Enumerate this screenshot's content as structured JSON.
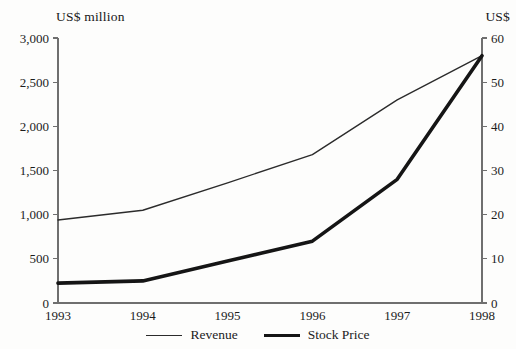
{
  "chart_data": {
    "type": "line",
    "title": "",
    "xlabel": "",
    "ylabel": "US$ million",
    "y2label": "US$",
    "categories": [
      "1993",
      "1994",
      "1995",
      "1996",
      "1997",
      "1998"
    ],
    "x": [
      1993,
      1994,
      1995,
      1996,
      1997,
      1998
    ],
    "xlim": [
      1993,
      1998
    ],
    "ylim": [
      0,
      3000
    ],
    "y2lim": [
      0,
      60
    ],
    "grid": false,
    "legend_position": "bottom-center",
    "series": [
      {
        "name": "Revenue",
        "axis": "left",
        "units": "US$ million",
        "line_style": "thin",
        "color": "#2b2b2b",
        "values": [
          940,
          1050,
          1360,
          1680,
          2300,
          2800
        ],
        "vertices": [
          1993,
          1994,
          1996,
          1997,
          1998
        ]
      },
      {
        "name": "Stock Price",
        "axis": "right",
        "units": "US$",
        "line_style": "thick",
        "color": "#151515",
        "values": [
          4.5,
          5.0,
          9.5,
          14.0,
          28.0,
          56.0
        ],
        "vertices": [
          1993,
          1994,
          1996,
          1997,
          1998
        ]
      }
    ],
    "y_ticks": [
      0,
      500,
      1000,
      1500,
      2000,
      2500,
      3000
    ],
    "y_tick_labels": [
      "0",
      "500",
      "1,000",
      "1,500",
      "2,000",
      "2,500",
      "3,000"
    ],
    "y2_ticks": [
      0,
      10,
      20,
      30,
      40,
      50,
      60
    ],
    "y2_tick_labels": [
      "0",
      "10",
      "20",
      "30",
      "40",
      "50",
      "60"
    ],
    "x_tick_labels": [
      "1993",
      "1994",
      "1995",
      "1996",
      "1997",
      "1998"
    ]
  },
  "axes": {
    "left_caption": "US$ million",
    "right_caption": "US$"
  },
  "legend": {
    "entries": [
      {
        "label": "Revenue",
        "style": "thin"
      },
      {
        "label": "Stock Price",
        "style": "thick"
      }
    ]
  }
}
